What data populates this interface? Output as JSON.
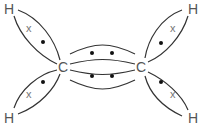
{
  "diagram": {
    "type": "dot-and-cross",
    "molecule": "ethene",
    "atoms": [
      {
        "id": "H1",
        "label": "H",
        "x": 9,
        "y": 15
      },
      {
        "id": "H2",
        "label": "H",
        "x": 9,
        "y": 118
      },
      {
        "id": "C1",
        "label": "C",
        "x": 63,
        "y": 68
      },
      {
        "id": "C2",
        "label": "C",
        "x": 141,
        "y": 68
      },
      {
        "id": "H3",
        "label": "H",
        "x": 193,
        "y": 15
      },
      {
        "id": "H4",
        "label": "H",
        "x": 193,
        "y": 118
      }
    ],
    "cross_symbol": "x",
    "bonds": [
      {
        "from": "H1",
        "to": "C1",
        "electrons": [
          "dot",
          "cross"
        ]
      },
      {
        "from": "H2",
        "to": "C1",
        "electrons": [
          "dot",
          "cross"
        ]
      },
      {
        "from": "C1",
        "to": "C2",
        "electrons": [
          "dot",
          "dot"
        ]
      },
      {
        "from": "C1",
        "to": "C2",
        "electrons": [
          "dot",
          "dot"
        ]
      },
      {
        "from": "H3",
        "to": "C2",
        "electrons": [
          "dot",
          "cross"
        ]
      },
      {
        "from": "H4",
        "to": "C2",
        "electrons": [
          "dot",
          "cross"
        ]
      }
    ]
  }
}
